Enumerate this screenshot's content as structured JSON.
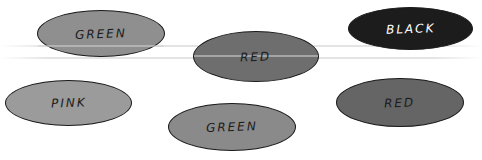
{
  "ellipses": [
    {
      "id": "green-top-left",
      "label": "GREEN",
      "fill": "#8f8f8f",
      "text_color": "#1a1a1a",
      "x": 37,
      "y": 10,
      "w": 128,
      "h": 47
    },
    {
      "id": "red-top-center",
      "label": "RED",
      "fill": "#6e6e6e",
      "text_color": "#1a1a1a",
      "x": 193,
      "y": 31,
      "w": 126,
      "h": 51
    },
    {
      "id": "black-top-right",
      "label": "BLACK",
      "fill": "#1c1c1c",
      "text_color": "#ffffff",
      "x": 348,
      "y": 7,
      "w": 125,
      "h": 43
    },
    {
      "id": "pink-bottom-left",
      "label": "PINK",
      "fill": "#9b9b9b",
      "text_color": "#1a1a1a",
      "x": 5,
      "y": 80,
      "w": 127,
      "h": 46
    },
    {
      "id": "green-bottom-center",
      "label": "GREEN",
      "fill": "#8a8a8a",
      "text_color": "#1a1a1a",
      "x": 168,
      "y": 103,
      "w": 128,
      "h": 48
    },
    {
      "id": "red-bottom-right",
      "label": "RED",
      "fill": "#656565",
      "text_color": "#1a1a1a",
      "x": 336,
      "y": 78,
      "w": 128,
      "h": 49
    }
  ]
}
